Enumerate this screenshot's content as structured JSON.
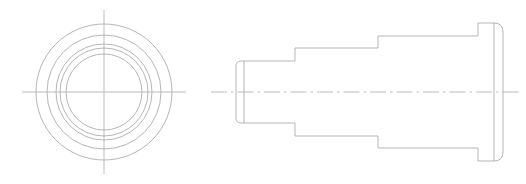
{
  "document": {
    "title": "Mechanical Part Technical Drawing",
    "background_color": "#ffffff",
    "line_color": "#a9a9ad",
    "width": 526,
    "height": 184,
    "projection": "third-angle orthographic",
    "views_count": 2
  },
  "chart_data": {
    "type": "table",
    "xlabel": "",
    "ylabel": "",
    "categories": [
      "front-view",
      "side-view"
    ],
    "values": [
      5,
      4
    ]
  },
  "front_view": {
    "name": "front-view",
    "label": "Front View (circular end face)",
    "center": {
      "x": 104,
      "y": 92
    },
    "circle_count": 5,
    "circles": [
      {
        "id": "circle-outer-1",
        "radius": 68.0,
        "diameter": 136.0,
        "role": "flange-outer-diameter"
      },
      {
        "id": "circle-2",
        "radius": 57.0,
        "diameter": 114.0,
        "role": "large-step-diameter"
      },
      {
        "id": "circle-3",
        "radius": 48.0,
        "diameter": 96.0,
        "role": "mid-step-diameter"
      },
      {
        "id": "circle-4",
        "radius": 44.0,
        "diameter": 88.0,
        "role": "chamfer-edge-diameter"
      },
      {
        "id": "circle-inner-5",
        "radius": 38.0,
        "diameter": 76.0,
        "role": "small-step-diameter"
      }
    ],
    "centerlines": {
      "horizontal": {
        "x1": 22,
        "y1": 92,
        "x2": 186,
        "y2": 92,
        "style": "thin-continuous"
      },
      "vertical": {
        "x1": 104,
        "y1": 10,
        "x2": 104,
        "y2": 174,
        "style": "thin-continuous"
      }
    }
  },
  "side_view": {
    "name": "side-view",
    "label": "Side View (stepped profile)",
    "axis": {
      "y": 92,
      "x_start": 211,
      "x_end": 521,
      "style": "dash-dot"
    },
    "steps": [
      {
        "id": "step-1-small-boss",
        "order": 1,
        "x_left": 236,
        "x_right": 295,
        "y_top": 61,
        "y_bottom": 123,
        "length": 59,
        "height": 62,
        "corner_radius_left": 5,
        "description": "smallest diameter boss with rounded left corners"
      },
      {
        "id": "step-2-mid-shaft",
        "order": 2,
        "x_left": 295,
        "x_right": 378,
        "y_top": 48,
        "y_bottom": 136,
        "length": 83,
        "height": 88,
        "corner_radius_left": 0,
        "description": "intermediate cylindrical shaft section"
      },
      {
        "id": "step-3-large-body",
        "order": 3,
        "x_left": 378,
        "x_right": 478,
        "y_top": 36,
        "y_bottom": 148,
        "length": 100,
        "height": 112,
        "corner_radius_left": 0,
        "description": "large diameter body section"
      },
      {
        "id": "step-4-end-flange",
        "order": 4,
        "x_left": 478,
        "x_right": 503,
        "y_top": 23,
        "y_bottom": 161,
        "length": 25,
        "height": 138,
        "corner_radius_right": 9,
        "description": "end flange with rounded right corners"
      }
    ],
    "internal_edge_lines": [
      {
        "id": "edge-boss-left-inner",
        "x": 244,
        "y_top": 61,
        "y_bottom": 123,
        "description": "rounded-corner tangent edge on small boss"
      },
      {
        "id": "edge-flange-right-inner",
        "x": 494,
        "y_top": 23,
        "y_bottom": 161,
        "description": "rounded-corner tangent edge on end flange"
      }
    ]
  }
}
